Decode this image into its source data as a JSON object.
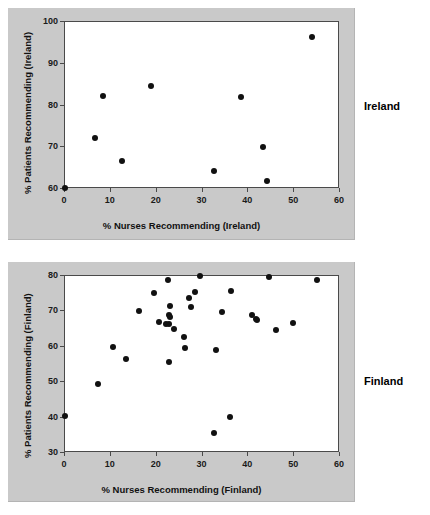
{
  "figure": {
    "background": "#ffffff",
    "panel_color": "#c9c9c9",
    "point_color": "#111111",
    "axis_color": "#4a4a4a"
  },
  "panels": [
    {
      "key": "ireland",
      "side_label": "Ireland"
    },
    {
      "key": "finland",
      "side_label": "Finland"
    }
  ],
  "chart_data": [
    {
      "type": "scatter",
      "title": "",
      "xlabel": "% Nurses Recommending (Ireland)",
      "ylabel": "% Patients Recommending (Ireland)",
      "xlim": [
        0,
        60
      ],
      "ylim": [
        60,
        100
      ],
      "xticks": [
        0,
        10,
        20,
        30,
        40,
        50,
        60
      ],
      "yticks": [
        60,
        70,
        80,
        90,
        100
      ],
      "grid": false,
      "legend": "none",
      "series": [
        {
          "name": "Ireland",
          "points": [
            [
              0.3,
              59.9
            ],
            [
              6.7,
              71.9
            ],
            [
              8.4,
              82.0
            ],
            [
              12.6,
              66.4
            ],
            [
              18.9,
              84.5
            ],
            [
              32.8,
              64.0
            ],
            [
              38.6,
              81.8
            ],
            [
              43.5,
              69.9
            ],
            [
              44.2,
              61.7
            ],
            [
              54.1,
              96.2
            ]
          ]
        }
      ]
    },
    {
      "type": "scatter",
      "title": "",
      "xlabel": "% Nurses Recommending (Finland)",
      "ylabel": "% Patients Recommending (Finland)",
      "xlim": [
        0,
        60
      ],
      "ylim": [
        30,
        80
      ],
      "xticks": [
        0,
        10,
        20,
        30,
        40,
        50,
        60
      ],
      "yticks": [
        30,
        40,
        50,
        60,
        70,
        80
      ],
      "grid": false,
      "legend": "none",
      "series": [
        {
          "name": "Finland",
          "points": [
            [
              0.2,
              40.2
            ],
            [
              7.4,
              49.1
            ],
            [
              10.6,
              59.6
            ],
            [
              13.5,
              56.3
            ],
            [
              16.4,
              69.8
            ],
            [
              19.6,
              74.8
            ],
            [
              20.8,
              66.8
            ],
            [
              22.2,
              66.2
            ],
            [
              22.6,
              78.6
            ],
            [
              22.8,
              68.6
            ],
            [
              23.0,
              66.1
            ],
            [
              23.1,
              71.2
            ],
            [
              23.2,
              68.0
            ],
            [
              22.9,
              55.3
            ],
            [
              24.0,
              64.8
            ],
            [
              26.2,
              62.5
            ],
            [
              26.4,
              59.4
            ],
            [
              27.2,
              73.5
            ],
            [
              27.8,
              71.1
            ],
            [
              28.6,
              75.3
            ],
            [
              29.6,
              79.8
            ],
            [
              32.8,
              35.4
            ],
            [
              33.1,
              58.9
            ],
            [
              34.4,
              69.5
            ],
            [
              36.2,
              39.8
            ],
            [
              36.4,
              75.6
            ],
            [
              41.1,
              68.6
            ],
            [
              41.9,
              67.5
            ],
            [
              42.2,
              67.2
            ],
            [
              44.7,
              79.4
            ],
            [
              46.2,
              64.6
            ],
            [
              50.0,
              66.3
            ],
            [
              55.1,
              78.7
            ]
          ]
        }
      ]
    }
  ]
}
